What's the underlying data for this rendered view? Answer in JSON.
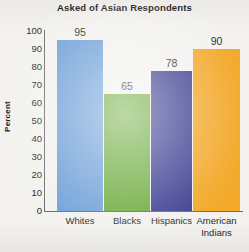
{
  "chart_data": {
    "type": "bar",
    "title": "Asked of Asian Respondents",
    "xlabel": "",
    "ylabel": "Percent",
    "categories": [
      "Whites",
      "Blacks",
      "Hispanics",
      "American\nIndians"
    ],
    "values": [
      95,
      65,
      78,
      90
    ],
    "value_labels": [
      "95",
      "65",
      "78",
      "90"
    ],
    "ylim": [
      0,
      100
    ],
    "yticks": [
      "100",
      "90",
      "80",
      "70",
      "60",
      "50",
      "40",
      "30",
      "20",
      "10",
      "0"
    ],
    "grid": false,
    "legend": "none",
    "bar_colors": [
      "#6fa0d8",
      "#6cab3c",
      "#3b3d90",
      "#f3a92b"
    ]
  },
  "style": {
    "background": "#f3f2ef",
    "axis_color": "#6d6d6d",
    "text_color": "#2a2a2a",
    "title_color": "#1b1b1b"
  }
}
